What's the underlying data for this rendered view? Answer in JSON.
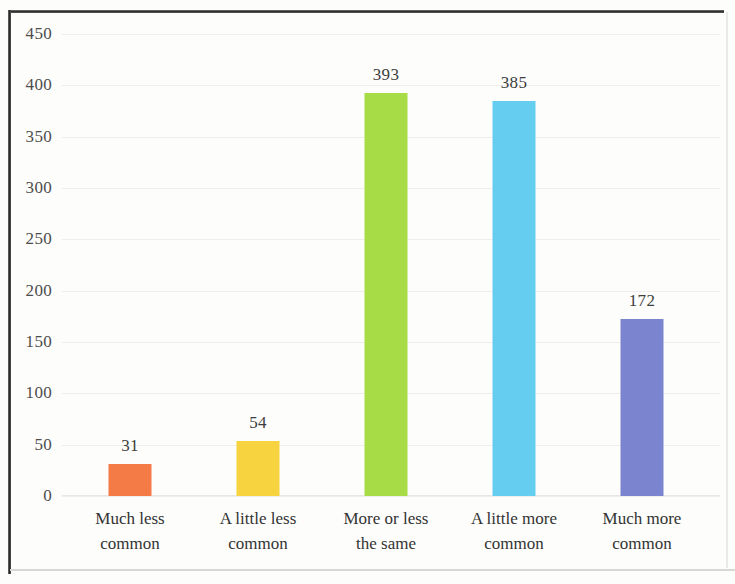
{
  "chart_data": {
    "type": "bar",
    "title": "",
    "subtitle": "",
    "xlabel": "",
    "ylabel": "",
    "ylim": [
      0,
      450
    ],
    "ytick_step": 50,
    "yticks": [
      "450",
      "400",
      "350",
      "300",
      "250",
      "200",
      "150",
      "100",
      "50",
      "0"
    ],
    "grid": true,
    "legend": "none",
    "categories": [
      "Much less common",
      "A little less common",
      "More or less the same",
      "A little more common",
      "Much more common"
    ],
    "category_lines": [
      [
        "Much less",
        "common"
      ],
      [
        "A little less",
        "common"
      ],
      [
        "More or less",
        "the same"
      ],
      [
        "A little more",
        "common"
      ],
      [
        "Much more",
        "common"
      ]
    ],
    "values": [
      31,
      54,
      393,
      385,
      172
    ],
    "value_labels": [
      "31",
      "54",
      "393",
      "385",
      "172"
    ],
    "colors": [
      "#F47B45",
      "#F7D33F",
      "#A8DC47",
      "#64CDF0",
      "#7B84CE"
    ],
    "bar_color_names": [
      "orange",
      "yellow",
      "green",
      "light-blue",
      "periwinkle"
    ]
  },
  "styles": {
    "background": "#fdfdfb",
    "grid_color": "#f0eeec",
    "axis_text_color": "#4d4d4d",
    "label_text_color": "#333333",
    "frame_color": "#2a2a2a"
  }
}
